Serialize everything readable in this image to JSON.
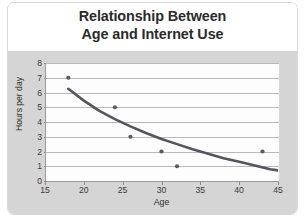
{
  "chart_data": {
    "type": "scatter",
    "title": "Relationship Between Age and Internet Use",
    "title_line1": "Relationship Between",
    "title_line2": "Age and Internet Use",
    "xlabel": "Age",
    "ylabel": "Hours per day",
    "xlim": [
      15,
      45
    ],
    "ylim": [
      0,
      8
    ],
    "xticks": [
      15,
      20,
      25,
      30,
      35,
      40,
      45
    ],
    "yticks": [
      0,
      1,
      2,
      3,
      4,
      5,
      6,
      7,
      8
    ],
    "grid": "horizontal",
    "legend": "none",
    "marker_color": "#5a5a66",
    "trendline_color": "#555560",
    "trendline_type": "power/exponential decay curve",
    "points": [
      {
        "age": 18,
        "hours": 7
      },
      {
        "age": 24,
        "hours": 5
      },
      {
        "age": 26,
        "hours": 3
      },
      {
        "age": 30,
        "hours": 2
      },
      {
        "age": 32,
        "hours": 1
      },
      {
        "age": 43,
        "hours": 2
      }
    ],
    "trendline": [
      {
        "age": 18,
        "hours": 6.25
      },
      {
        "age": 20,
        "hours": 5.45
      },
      {
        "age": 22,
        "hours": 4.75
      },
      {
        "age": 24,
        "hours": 4.2
      },
      {
        "age": 26,
        "hours": 3.7
      },
      {
        "age": 28,
        "hours": 3.25
      },
      {
        "age": 30,
        "hours": 2.85
      },
      {
        "age": 32,
        "hours": 2.5
      },
      {
        "age": 34,
        "hours": 2.15
      },
      {
        "age": 36,
        "hours": 1.85
      },
      {
        "age": 38,
        "hours": 1.55
      },
      {
        "age": 40,
        "hours": 1.3
      },
      {
        "age": 42,
        "hours": 1.05
      },
      {
        "age": 44,
        "hours": 0.8
      },
      {
        "age": 45,
        "hours": 0.72
      }
    ]
  },
  "colors": {
    "plot_background": "#fdfdfd",
    "outer_background": "#d5d5d5",
    "card_background": "#ffffff",
    "gridline": "#b9b9b9",
    "axis": "#9a9a9a",
    "title_text": "#2b2b2b",
    "tick_text": "#3a3a3a"
  }
}
